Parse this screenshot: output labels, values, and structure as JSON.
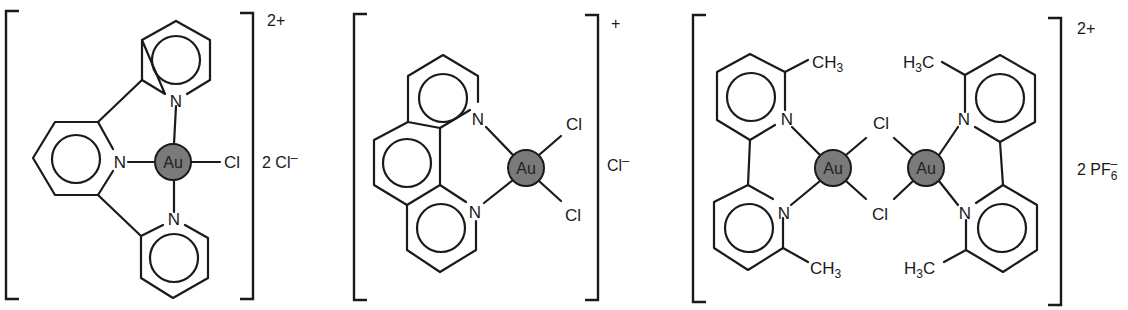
{
  "figure": {
    "colors": {
      "line": "#1a1a1a",
      "metal_fill": "#7a7a7a",
      "background": "#ffffff"
    }
  },
  "complexes": [
    {
      "id": "complex-1",
      "ligand": "terpyridine",
      "metal_label": "Au",
      "donor_atoms": [
        "N",
        "N",
        "N"
      ],
      "terminal_ligand": "Cl",
      "charge": "2+",
      "counterion_coeff": "2",
      "counterion": "Cl",
      "counterion_charge": "–"
    },
    {
      "id": "complex-2",
      "ligand": "phenanthroline",
      "metal_label": "Au",
      "donor_atoms": [
        "N",
        "N"
      ],
      "terminal_ligands": [
        "Cl",
        "Cl"
      ],
      "charge": "+",
      "counterion": "Cl",
      "counterion_charge": "–"
    },
    {
      "id": "complex-3",
      "ligand": "6,6'-dimethyl-2,2'-bipyridine (x2)",
      "metal_labels": [
        "Au",
        "Au"
      ],
      "donor_atoms": [
        "N",
        "N",
        "N",
        "N"
      ],
      "bridging_ligands": [
        "Cl",
        "Cl"
      ],
      "methyl_labels": {
        "right_facing": {
          "main": "CH",
          "sub": "3"
        },
        "left_facing": {
          "main": "H",
          "sub": "3",
          "tail": "C"
        }
      },
      "charge": "2+",
      "counterion_coeff": "2",
      "counterion": "PF",
      "counterion_sub": "6",
      "counterion_charge": "–"
    }
  ]
}
